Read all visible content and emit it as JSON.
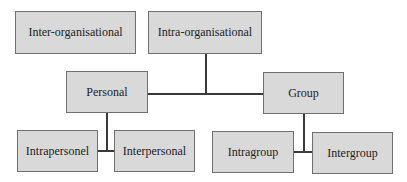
{
  "diagram": {
    "type": "hierarchy",
    "colors": {
      "box_fill": "#d9d9d9",
      "box_border": "#6f6f6f",
      "line": "#3a3a3a",
      "text": "#222222",
      "background": "#ffffff"
    },
    "nodes": {
      "inter_organisational": "Inter-organisational",
      "intra_organisational": "Intra-organisational",
      "personal": "Personal",
      "group": "Group",
      "intrapersonel": "Intrapersonel",
      "interpersonal": "Interpersonal",
      "intragroup": "Intragroup",
      "intergroup": "Intergroup"
    },
    "edges": [
      [
        "Intra-organisational",
        "Personal"
      ],
      [
        "Intra-organisational",
        "Group"
      ],
      [
        "Personal",
        "Intrapersonel"
      ],
      [
        "Personal",
        "Interpersonal"
      ],
      [
        "Group",
        "Intragroup"
      ],
      [
        "Group",
        "Intergroup"
      ]
    ]
  }
}
